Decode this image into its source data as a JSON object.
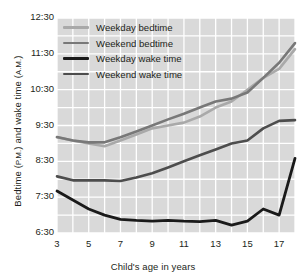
{
  "chart_data": {
    "type": "line",
    "title": "",
    "xlabel": "Child's age in years",
    "ylabel_main": "Bedtime (",
    "ylabel_pm": "P.M.",
    "ylabel_mid": ") and wake time (",
    "ylabel_am": "A.M.",
    "ylabel_end": ")",
    "ylabel_full": "Bedtime (P.M.) and wake time (A.M.)",
    "x": [
      3,
      4,
      5,
      6,
      7,
      8,
      9,
      10,
      11,
      12,
      13,
      14,
      15,
      16,
      17,
      18
    ],
    "xtick_values": [
      3,
      5,
      7,
      9,
      11,
      13,
      15,
      17
    ],
    "xtick_labels": [
      "3",
      "5",
      "7",
      "9",
      "11",
      "13",
      "15",
      "17"
    ],
    "xlim": [
      3,
      18
    ],
    "ytick_labels": [
      "12:30",
      "11:30",
      "10:30",
      "9:30",
      "8:30",
      "7:30",
      "6:30"
    ],
    "ytick_values": [
      12.5,
      11.5,
      10.5,
      9.5,
      8.5,
      7.5,
      6.5
    ],
    "ylim": [
      6.5,
      12.5
    ],
    "grid": true,
    "legend_position": "top-left inside plot",
    "plot_bg": "#d9d9d9",
    "grid_color": "#ffffff",
    "series": [
      {
        "name": "Weekday bedtime",
        "color": "#a9a9a9",
        "width": 2.6,
        "values": [
          9.17,
          9.08,
          9.0,
          8.92,
          9.08,
          9.25,
          9.42,
          9.5,
          9.58,
          9.75,
          10.0,
          10.17,
          10.5,
          10.83,
          11.08,
          11.63
        ],
        "value_labels": [
          "9:10",
          "9:05",
          "9:00",
          "8:55",
          "9:05",
          "9:15",
          "9:25",
          "9:30",
          "9:35",
          "9:45",
          "10:00",
          "10:10",
          "10:30",
          "10:50",
          "11:05",
          "11:38"
        ]
      },
      {
        "name": "Weekend bedtime",
        "color": "#787878",
        "width": 2.6,
        "values": [
          9.18,
          9.08,
          9.03,
          9.03,
          9.17,
          9.33,
          9.5,
          9.67,
          9.83,
          10.0,
          10.17,
          10.25,
          10.42,
          10.83,
          11.25,
          11.8
        ],
        "value_labels": [
          "9:11",
          "9:05",
          "9:02",
          "9:02",
          "9:10",
          "9:20",
          "9:30",
          "9:40",
          "9:50",
          "10:00",
          "10:10",
          "10:15",
          "10:25",
          "10:50",
          "11:15",
          "11:48"
        ]
      },
      {
        "name": "Weekday wake time",
        "color": "#1a1a1a",
        "width": 2.8,
        "values": [
          7.67,
          7.42,
          7.17,
          7.0,
          6.88,
          6.85,
          6.83,
          6.85,
          6.83,
          6.82,
          6.85,
          6.72,
          6.83,
          7.17,
          7.0,
          8.58
        ],
        "value_labels": [
          "7:40",
          "7:25",
          "7:10",
          "7:00",
          "6:53",
          "6:51",
          "6:50",
          "6:51",
          "6:50",
          "6:49",
          "6:51",
          "6:43",
          "6:50",
          "7:10",
          "7:00",
          "8:35"
        ]
      },
      {
        "name": "Weekend wake time",
        "color": "#4d4d4d",
        "width": 2.6,
        "values": [
          8.08,
          7.97,
          7.97,
          7.97,
          7.95,
          8.05,
          8.17,
          8.33,
          8.5,
          8.67,
          8.83,
          9.0,
          9.08,
          9.42,
          9.63,
          9.65
        ],
        "value_labels": [
          "8:05",
          "7:58",
          "7:58",
          "7:58",
          "7:57",
          "8:03",
          "8:10",
          "8:20",
          "8:30",
          "8:40",
          "8:50",
          "9:00",
          "9:05",
          "9:25",
          "9:38",
          "9:39"
        ]
      }
    ]
  },
  "legend": {
    "items": [
      {
        "label": "Weekday bedtime"
      },
      {
        "label": "Weekend bedtime"
      },
      {
        "label": "Weekday wake time"
      },
      {
        "label": "Weekend wake time"
      }
    ]
  }
}
